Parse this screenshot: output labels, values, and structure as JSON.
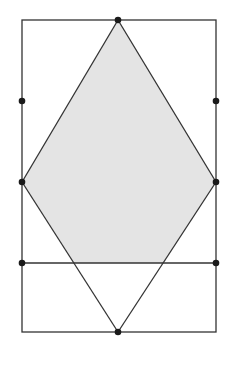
{
  "diagram": {
    "colors": {
      "stroke": "#333333",
      "fill": "#e4e4e4",
      "dot": "#1a1a1a",
      "background": "#ffffff"
    },
    "rectangle": {
      "x": 22,
      "y": 20,
      "width": 194,
      "height": 312
    },
    "shaded_region": [
      [
        118,
        20
      ],
      [
        216,
        182
      ],
      [
        164,
        263
      ],
      [
        74,
        263
      ],
      [
        22,
        182
      ]
    ],
    "lines": [
      {
        "x1": 118,
        "y1": 20,
        "x2": 216,
        "y2": 182
      },
      {
        "x1": 118,
        "y1": 20,
        "x2": 22,
        "y2": 182
      },
      {
        "x1": 22,
        "y1": 182,
        "x2": 118,
        "y2": 332
      },
      {
        "x1": 216,
        "y1": 182,
        "x2": 118,
        "y2": 332
      },
      {
        "x1": 22,
        "y1": 263,
        "x2": 216,
        "y2": 263
      }
    ],
    "points": [
      [
        118,
        20
      ],
      [
        22,
        101
      ],
      [
        216,
        101
      ],
      [
        22,
        182
      ],
      [
        216,
        182
      ],
      [
        22,
        263
      ],
      [
        216,
        263
      ],
      [
        118,
        332
      ]
    ]
  }
}
